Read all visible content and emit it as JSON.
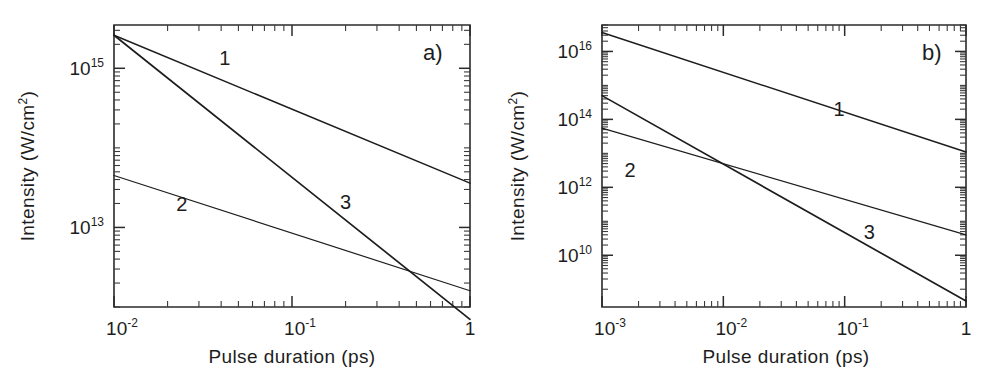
{
  "figure": {
    "panel_count": 2,
    "background_color": "#ffffff",
    "line_color": "#1d1d1d"
  },
  "chart_data": [
    {
      "id": "panel-a",
      "type": "line",
      "panel_label": "a)",
      "title": "",
      "xlabel": "Pulse duration (ps)",
      "ylabel": "Intensity (W/cm²)",
      "ylabel_parts": {
        "pre": "Intensity (W/cm",
        "sup": "2",
        "post": ")"
      },
      "xscale": "log",
      "yscale": "log",
      "xlim": [
        0.01,
        1
      ],
      "ylim": [
        1000000000000.0,
        3500000000000000.0
      ],
      "grid": false,
      "legend": "inline-curve-numbers",
      "xticks": [
        {
          "value": 0.01,
          "mantissa": "10",
          "exponent": "-2"
        },
        {
          "value": 0.1,
          "mantissa": "10",
          "exponent": "-1"
        },
        {
          "value": 1,
          "mantissa": "1",
          "exponent": ""
        }
      ],
      "yticks": [
        {
          "value": 1000000000000000.0,
          "mantissa": "10",
          "exponent": "15"
        },
        {
          "value": 10000000000000.0,
          "mantissa": "10",
          "exponent": "13"
        }
      ],
      "series": [
        {
          "name": "1",
          "label": "1",
          "label_at": {
            "x": 0.042,
            "y": 1100000000000000.0
          },
          "points": [
            {
              "x": 0.01,
              "y": 2600000000000000.0
            },
            {
              "x": 1.0,
              "y": 36000000000000.0
            }
          ]
        },
        {
          "name": "2",
          "label": "2",
          "label_at": {
            "x": 0.024,
            "y": 16000000000000.0
          },
          "points": [
            {
              "x": 0.01,
              "y": 45000000000000.0
            },
            {
              "x": 1.0,
              "y": 1600000000000.0
            }
          ]
        },
        {
          "name": "3",
          "label": "3",
          "label_at": {
            "x": 0.2,
            "y": 17000000000000.0
          },
          "points": [
            {
              "x": 0.01,
              "y": 2600000000000000.0
            },
            {
              "x": 1.0,
              "y": 700000000000.0
            }
          ]
        }
      ]
    },
    {
      "id": "panel-b",
      "type": "line",
      "panel_label": "b)",
      "title": "",
      "xlabel": "Pulse duration (ps)",
      "ylabel": "Intensity (W/cm²)",
      "ylabel_parts": {
        "pre": "Intensity (W/cm",
        "sup": "2",
        "post": ")"
      },
      "xscale": "log",
      "yscale": "log",
      "xlim": [
        0.001,
        1
      ],
      "ylim": [
        300000000.0,
        6e+16
      ],
      "grid": false,
      "legend": "inline-curve-numbers",
      "xticks": [
        {
          "value": 0.001,
          "mantissa": "10",
          "exponent": "-3"
        },
        {
          "value": 0.01,
          "mantissa": "10",
          "exponent": "-2"
        },
        {
          "value": 0.1,
          "mantissa": "10",
          "exponent": "-1"
        },
        {
          "value": 1,
          "mantissa": "1",
          "exponent": ""
        }
      ],
      "yticks": [
        {
          "value": 1e+16,
          "mantissa": "10",
          "exponent": "16"
        },
        {
          "value": 100000000000000.0,
          "mantissa": "10",
          "exponent": "14"
        },
        {
          "value": 1000000000000.0,
          "mantissa": "10",
          "exponent": "12"
        },
        {
          "value": 10000000000.0,
          "mantissa": "10",
          "exponent": "10"
        }
      ],
      "series": [
        {
          "name": "1",
          "label": "1",
          "label_at": {
            "x": 0.09,
            "y": 130000000000000.0
          },
          "points": [
            {
              "x": 0.001,
              "y": 3.6e+16
            },
            {
              "x": 1.0,
              "y": 11000000000000.0
            }
          ]
        },
        {
          "name": "2",
          "label": "2",
          "label_at": {
            "x": 0.0017,
            "y": 2000000000000.0
          },
          "points": [
            {
              "x": 0.001,
              "y": 55000000000000.0
            },
            {
              "x": 1.0,
              "y": 40000000000.0
            }
          ]
        },
        {
          "name": "3",
          "label": "3",
          "label_at": {
            "x": 0.16,
            "y": 30000000000.0
          },
          "points": [
            {
              "x": 0.001,
              "y": 500000000000000.0
            },
            {
              "x": 1.0,
              "y": 450000000.0
            }
          ]
        }
      ]
    }
  ]
}
